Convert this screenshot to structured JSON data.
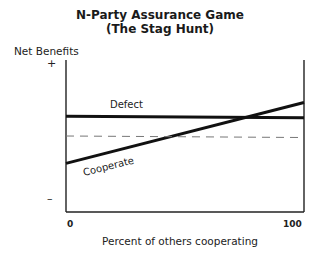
{
  "title_line1": "N-Party Assurance Game",
  "title_line2": "(The Stag Hunt)",
  "y_axis_label": "Net Benefits",
  "y_plus": "+",
  "y_minus": "–",
  "x_tick_min": "0",
  "x_tick_max": "100",
  "x_axis_label": "Percent of others cooperating",
  "chart_data": {
    "type": "line",
    "xlabel": "Percent of others cooperating",
    "ylabel": "Net Benefits",
    "xlim": [
      0,
      100
    ],
    "ylim": [
      "-",
      "+"
    ],
    "x_ticks": [
      "0",
      "100"
    ],
    "y_ticks": [
      "–",
      "+"
    ],
    "series": [
      {
        "name": "Defect",
        "style": "solid",
        "x": [
          0,
          100
        ],
        "y": [
          0.63,
          0.62
        ]
      },
      {
        "name": "Cooperate",
        "style": "solid",
        "x": [
          0,
          100
        ],
        "y": [
          0.32,
          0.72
        ]
      },
      {
        "name": "Reference (zero net benefit)",
        "style": "dashed",
        "x": [
          0,
          100
        ],
        "y": [
          0.5,
          0.49
        ]
      }
    ],
    "annotations": [
      {
        "text": "Defect",
        "near_series": "Defect"
      },
      {
        "text": "Cooperate",
        "near_series": "Cooperate"
      }
    ],
    "crossover_percent": 78,
    "grid": false,
    "legend": "none"
  }
}
